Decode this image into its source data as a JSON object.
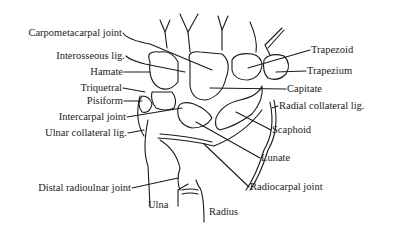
{
  "figure": {
    "labels_left": [
      {
        "id": "carpometacarpal-joint",
        "text": "Carpometacarpal joint",
        "x": 122,
        "y": 33
      },
      {
        "id": "interosseous-lig",
        "text": "Interosseous lig.",
        "x": 125,
        "y": 56
      },
      {
        "id": "hamate",
        "text": "Hamate",
        "x": 123,
        "y": 72
      },
      {
        "id": "triquetral",
        "text": "Triquetral",
        "x": 122,
        "y": 88
      },
      {
        "id": "pisiform",
        "text": "Pisiform",
        "x": 123,
        "y": 101
      },
      {
        "id": "intercarpal-joint",
        "text": "Intercarpal joint",
        "x": 126,
        "y": 117
      },
      {
        "id": "ulnar-collateral-lig",
        "text": "Ulnar collateral lig.",
        "x": 127,
        "y": 133
      },
      {
        "id": "distal-radioulnar-joint",
        "text": "Distal radioulnar joint",
        "x": 131,
        "y": 188
      }
    ],
    "labels_right": [
      {
        "id": "trapezoid",
        "text": "Trapezoid",
        "x": 311,
        "y": 50
      },
      {
        "id": "trapezium",
        "text": "Trapezium",
        "x": 307,
        "y": 71
      },
      {
        "id": "capitate",
        "text": "Capitate",
        "x": 287,
        "y": 89
      },
      {
        "id": "radial-collateral-lig",
        "text": "Radial collateral lig.",
        "x": 279,
        "y": 106
      },
      {
        "id": "scaphoid",
        "text": "Scaphoid",
        "x": 272,
        "y": 130
      },
      {
        "id": "lunate",
        "text": "Lunate",
        "x": 261,
        "y": 158
      },
      {
        "id": "radiocarpal-joint",
        "text": "Radiocarpal joint",
        "x": 250,
        "y": 187
      }
    ],
    "labels_bottom": [
      {
        "id": "ulna",
        "text": "Ulna",
        "x": 148,
        "y": 205
      },
      {
        "id": "radius",
        "text": "Radius",
        "x": 209,
        "y": 212
      }
    ],
    "line_color": "#1a1a1a"
  }
}
